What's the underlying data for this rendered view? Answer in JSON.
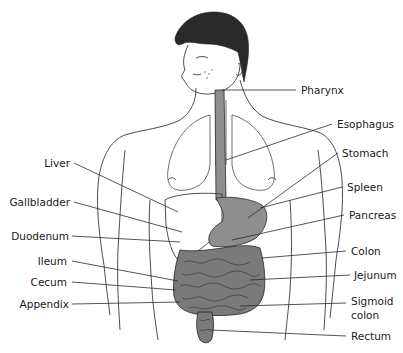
{
  "labels": {
    "left": [
      {
        "id": "liver",
        "text": "Liver"
      },
      {
        "id": "gallbladder",
        "text": "Gallbladder"
      },
      {
        "id": "duodenum",
        "text": "Duodenum"
      },
      {
        "id": "ileum",
        "text": "Ileum"
      },
      {
        "id": "cecum",
        "text": "Cecum"
      },
      {
        "id": "appendix",
        "text": "Appendix"
      }
    ],
    "right": [
      {
        "id": "pharynx",
        "text": "Pharynx"
      },
      {
        "id": "esophagus",
        "text": "Esophagus"
      },
      {
        "id": "stomach",
        "text": "Stomach"
      },
      {
        "id": "spleen",
        "text": "Spleen"
      },
      {
        "id": "pancreas",
        "text": "Pancreas"
      },
      {
        "id": "colon",
        "text": "Colon"
      },
      {
        "id": "jejunum",
        "text": "Jejunum"
      },
      {
        "id": "sigmoid_colon_line1",
        "text": "Sigmoid"
      },
      {
        "id": "sigmoid_colon_line2",
        "text": "colon"
      },
      {
        "id": "rectum",
        "text": "Rectum"
      }
    ]
  },
  "colors": {
    "organ_fill": "#8e8e8e",
    "line": "#2b2b2b",
    "hair": "#2a2a2a"
  }
}
